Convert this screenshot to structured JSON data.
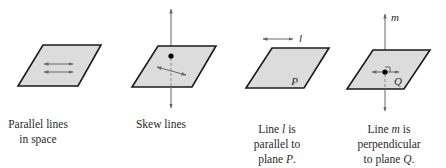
{
  "figure": {
    "colors": {
      "plane_fill": "#dcdcdc",
      "plane_stroke": "#1a1a1a",
      "line_color": "#666666",
      "point_color": "#000000",
      "text_color": "#2a2a2a"
    },
    "panels": [
      {
        "id": "parallel-lines",
        "caption_lines": [
          "Parallel lines",
          "in space"
        ]
      },
      {
        "id": "skew-lines",
        "caption_lines": [
          "Skew lines"
        ]
      },
      {
        "id": "line-parallel-plane",
        "line_label": "l",
        "plane_label": "P",
        "caption_lines": [
          "Line l is",
          "parallel to",
          "plane P."
        ]
      },
      {
        "id": "line-perpendicular-plane",
        "line_label": "m",
        "plane_label": "Q",
        "caption_lines": [
          "Line m is",
          "perpendicular",
          "to plane Q."
        ]
      }
    ]
  }
}
